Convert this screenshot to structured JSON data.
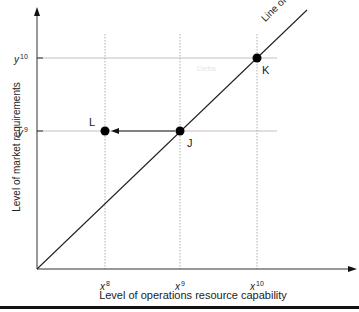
{
  "diagram": {
    "y_axis_label": "Level of market requirements",
    "x_axis_label": "Level of operations resource capability",
    "line_label": "Line of fit",
    "faint_text": "Delta",
    "x_ticks": [
      {
        "base": "x",
        "sup": "8"
      },
      {
        "base": "x",
        "sup": "9"
      },
      {
        "base": "x",
        "sup": "10"
      }
    ],
    "y_ticks": [
      {
        "base": "y",
        "sup": "10"
      },
      {
        "base": "y",
        "sup": "9"
      }
    ],
    "points": [
      {
        "id": "J",
        "label": "J",
        "x": "x9",
        "y": "y9"
      },
      {
        "id": "K",
        "label": "K",
        "x": "x10",
        "y": "y10"
      },
      {
        "id": "L",
        "label": "L",
        "x": "x8",
        "y": "y9"
      }
    ],
    "arrow": {
      "from": "J",
      "to": "L"
    },
    "colors": {
      "line": "#222222",
      "grid": "#9a9a9a",
      "point": "#000000",
      "bar": "#111111"
    }
  }
}
